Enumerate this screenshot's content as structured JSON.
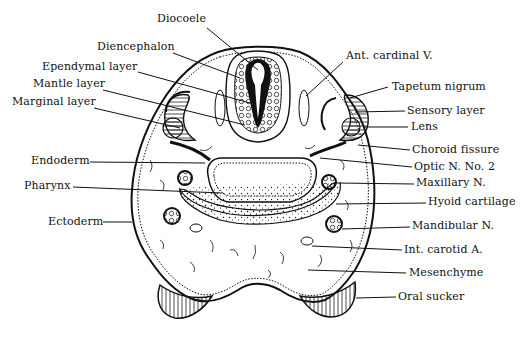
{
  "figure": {
    "labels": {
      "left": [
        {
          "id": "diencephalon",
          "text": "Diencephalon",
          "x": 97,
          "y": 47
        },
        {
          "id": "ependymal_layer",
          "text": "Ependymal layer",
          "x": 42,
          "y": 67
        },
        {
          "id": "mantle_layer",
          "text": "Mantle layer",
          "x": 33,
          "y": 84
        },
        {
          "id": "marginal_layer",
          "text": "Marginal layer",
          "x": 12,
          "y": 101
        },
        {
          "id": "endoderm",
          "text": "Endoderm",
          "x": 31,
          "y": 155
        },
        {
          "id": "pharynx",
          "text": "Pharynx",
          "x": 24,
          "y": 180
        },
        {
          "id": "ectoderm",
          "text": "Ectoderm",
          "x": 48,
          "y": 216
        }
      ],
      "top": [
        {
          "id": "diocoele",
          "text": "Diocoele",
          "x": 157,
          "y": 19
        }
      ],
      "right": [
        {
          "id": "ant_cardinal_v",
          "text": "Ant. cardinal V.",
          "x": 346,
          "y": 50
        },
        {
          "id": "tapetum_nigrum",
          "text": "Tapetum nigrum",
          "x": 392,
          "y": 81
        },
        {
          "id": "sensory_layer",
          "text": "Sensory layer",
          "x": 407,
          "y": 105
        },
        {
          "id": "lens",
          "text": "Lens",
          "x": 411,
          "y": 121
        },
        {
          "id": "choroid_fissure",
          "text": "Choroid fissure",
          "x": 412,
          "y": 144
        },
        {
          "id": "optic_n_no_2",
          "text": "Optic N. No. 2",
          "x": 414,
          "y": 161
        },
        {
          "id": "maxillary_n",
          "text": "Maxillary N.",
          "x": 416,
          "y": 177
        },
        {
          "id": "hyoid_cartilage",
          "text": "Hyoid cartilage",
          "x": 428,
          "y": 196
        },
        {
          "id": "mandibular_n",
          "text": "Mandibular N.",
          "x": 412,
          "y": 220
        },
        {
          "id": "int_carotid_a",
          "text": "Int. carotid A.",
          "x": 404,
          "y": 244
        },
        {
          "id": "mesenchyme",
          "text": "Mesenchyme",
          "x": 409,
          "y": 267
        },
        {
          "id": "oral_sucker",
          "text": "Oral sucker",
          "x": 398,
          "y": 291
        }
      ]
    },
    "colors": {
      "ink": "#111111",
      "paper": "#ffffff",
      "shade": "#333333"
    }
  }
}
